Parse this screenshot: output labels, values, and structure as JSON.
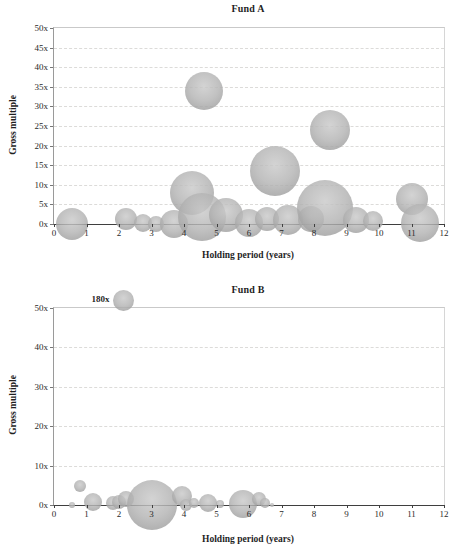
{
  "style": {
    "background": "#ffffff",
    "bubble_fill": "#b4b4b4",
    "bubble_edge": "#8e8e8e",
    "gridline_color": "#dcdbd9",
    "axis_color": "#3f3f3f",
    "text_color": "#1f1f1f"
  },
  "chart_data": [
    {
      "type": "scatter",
      "subtype": "bubble",
      "title": "Fund A",
      "xlabel": "Holding period (years)",
      "ylabel": "Gross multiple",
      "xlim": [
        0,
        12
      ],
      "ylim": [
        0,
        50
      ],
      "x_tick_step": 1,
      "y_tick_step": 5,
      "x_tick_labels": [
        "0",
        "1",
        "2",
        "3",
        "4",
        "5",
        "6",
        "7",
        "8",
        "9",
        "10",
        "11",
        "12"
      ],
      "y_tick_labels": [
        "0x",
        "5x",
        "10x",
        "15x",
        "20x",
        "25x",
        "30x",
        "35x",
        "40x",
        "45x",
        "50x"
      ],
      "grid": "horizontal dashed",
      "legend": "none",
      "points": [
        {
          "x": 0.55,
          "y": 0,
          "r_px": 16
        },
        {
          "x": 2.2,
          "y": 1.4,
          "r_px": 11
        },
        {
          "x": 2.75,
          "y": 0.3,
          "r_px": 9
        },
        {
          "x": 3.15,
          "y": 0,
          "r_px": 8
        },
        {
          "x": 3.7,
          "y": 0,
          "r_px": 14
        },
        {
          "x": 4.25,
          "y": 8,
          "r_px": 22
        },
        {
          "x": 4.6,
          "y": 34,
          "r_px": 19
        },
        {
          "x": 4.55,
          "y": 1.8,
          "r_px": 24
        },
        {
          "x": 5.3,
          "y": 2.4,
          "r_px": 17
        },
        {
          "x": 6.0,
          "y": 0.3,
          "r_px": 14
        },
        {
          "x": 6.55,
          "y": 1.3,
          "r_px": 12
        },
        {
          "x": 6.8,
          "y": 13.5,
          "r_px": 25
        },
        {
          "x": 7.2,
          "y": 1,
          "r_px": 15
        },
        {
          "x": 7.9,
          "y": 1.3,
          "r_px": 13
        },
        {
          "x": 8.35,
          "y": 4,
          "r_px": 28
        },
        {
          "x": 8.5,
          "y": 24,
          "r_px": 20
        },
        {
          "x": 9.3,
          "y": 1,
          "r_px": 13
        },
        {
          "x": 9.8,
          "y": 0.8,
          "r_px": 10
        },
        {
          "x": 11.0,
          "y": 6.5,
          "r_px": 16
        },
        {
          "x": 11.25,
          "y": 0.3,
          "r_px": 19
        }
      ]
    },
    {
      "type": "scatter",
      "subtype": "bubble",
      "title": "Fund B",
      "xlabel": "Holding period (years)",
      "ylabel": "Gross multiple",
      "xlim": [
        0,
        12
      ],
      "ylim": [
        0,
        50
      ],
      "x_tick_step": 1,
      "y_tick_step": 10,
      "x_tick_labels": [
        "0",
        "1",
        "2",
        "3",
        "4",
        "5",
        "6",
        "7",
        "8",
        "9",
        "10",
        "11",
        "12"
      ],
      "y_tick_labels": [
        "0x",
        "10x",
        "20x",
        "30x",
        "40x",
        "50x"
      ],
      "grid": "horizontal dashed",
      "legend": "none",
      "outlier": {
        "label": "180x",
        "x": 2.15,
        "y": 180,
        "r_px": 10.5,
        "note": "plotted just above the 50x axis limit"
      },
      "points": [
        {
          "x": 0.55,
          "y": 0,
          "r_px": 3
        },
        {
          "x": 0.8,
          "y": 4.8,
          "r_px": 6
        },
        {
          "x": 1.2,
          "y": 0.8,
          "r_px": 9
        },
        {
          "x": 1.8,
          "y": 0.4,
          "r_px": 7
        },
        {
          "x": 2.0,
          "y": 0.8,
          "r_px": 7
        },
        {
          "x": 2.2,
          "y": 1.4,
          "r_px": 8
        },
        {
          "x": 3.0,
          "y": 0,
          "r_px": 25
        },
        {
          "x": 3.95,
          "y": 2.2,
          "r_px": 10
        },
        {
          "x": 4.05,
          "y": 0,
          "r_px": 6
        },
        {
          "x": 4.3,
          "y": 0.4,
          "r_px": 5
        },
        {
          "x": 4.75,
          "y": 0.4,
          "r_px": 9
        },
        {
          "x": 5.1,
          "y": 0.2,
          "r_px": 4
        },
        {
          "x": 5.8,
          "y": 0.2,
          "r_px": 14
        },
        {
          "x": 6.3,
          "y": 1.4,
          "r_px": 7
        },
        {
          "x": 6.5,
          "y": 0.4,
          "r_px": 5
        },
        {
          "x": 6.7,
          "y": 0,
          "r_px": 2
        }
      ]
    }
  ]
}
